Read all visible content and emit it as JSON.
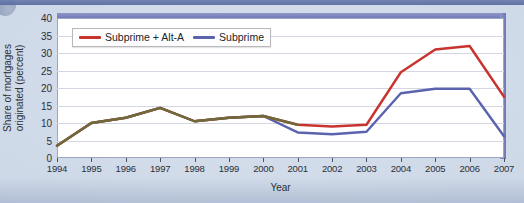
{
  "chart_data": {
    "type": "line",
    "title": "",
    "xlabel": "Year",
    "ylabel_line1": "Share of mortgages",
    "ylabel_line2": "originated (percent)",
    "x": [
      1994,
      1995,
      1996,
      1997,
      1998,
      1999,
      2000,
      2001,
      2002,
      2003,
      2004,
      2005,
      2006,
      2007
    ],
    "categories": [
      "1994",
      "1995",
      "1996",
      "1997",
      "1998",
      "1999",
      "2000",
      "2001",
      "2002",
      "2003",
      "2004",
      "2005",
      "2006",
      "2007"
    ],
    "xlim": [
      1994,
      2007
    ],
    "ylim": [
      0,
      40
    ],
    "yticks": [
      0,
      5,
      10,
      15,
      20,
      25,
      30,
      35,
      40
    ],
    "grid": "horizontal",
    "legend_position": "top-left",
    "series": [
      {
        "name": "Subprime + Alt-A",
        "color": "#c8332e",
        "values": [
          3.5,
          10.0,
          11.5,
          14.3,
          10.5,
          11.5,
          12.0,
          9.5,
          9.0,
          9.5,
          24.5,
          31.0,
          32.0,
          17.5
        ]
      },
      {
        "name": "Subprime",
        "color": "#5b63ae",
        "values": [
          3.5,
          10.0,
          11.5,
          14.3,
          10.5,
          11.5,
          12.0,
          7.3,
          6.8,
          7.5,
          18.5,
          19.8,
          19.8,
          6.2
        ]
      }
    ],
    "overlap_color": "#6e6a3a",
    "overlap_note": "Series overlap exactly from 1994 through 2000"
  },
  "legend": {
    "items": [
      {
        "label": "Subprime + Alt-A",
        "color": "#c8332e"
      },
      {
        "label": "Subprime",
        "color": "#5b63ae"
      }
    ]
  },
  "axes": {
    "y_label_line1": "Share of mortgages",
    "y_label_line2": "originated (percent)",
    "x_label": "Year",
    "y_ticks": [
      "0",
      "5",
      "10",
      "15",
      "20",
      "25",
      "30",
      "35",
      "40"
    ],
    "x_ticks": [
      "1994",
      "1995",
      "1996",
      "1997",
      "1998",
      "1999",
      "2000",
      "2001",
      "2002",
      "2003",
      "2004",
      "2005",
      "2006",
      "2007"
    ]
  },
  "colors": {
    "subprime_alt_a": "#c8332e",
    "subprime": "#5b63ae",
    "frame": "#7a83bb",
    "page_background": "#cdd8e7",
    "plot_background": "#ffffff",
    "gridline": "#d2d7e2"
  }
}
